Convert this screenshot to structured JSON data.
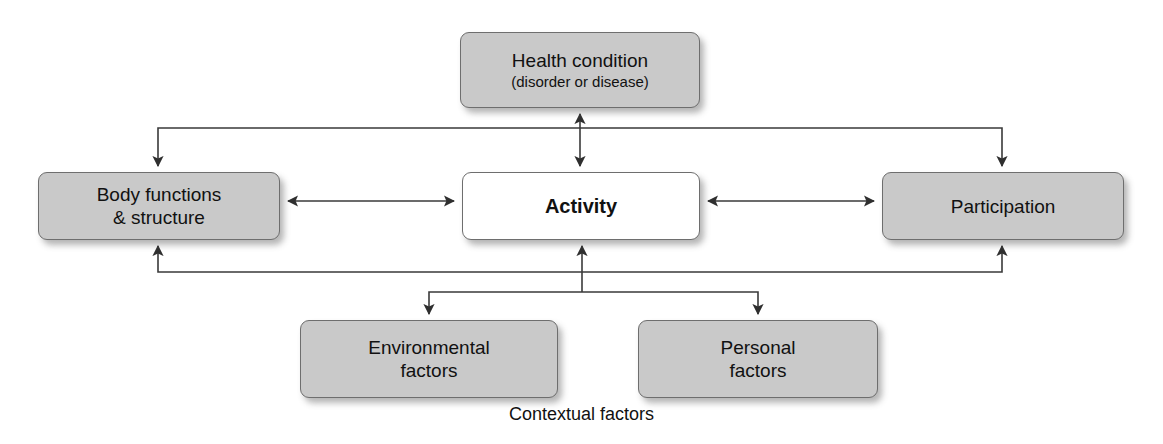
{
  "diagram": {
    "colors": {
      "node_fill": "#c9c9c9",
      "node_fill_highlight": "#ffffff",
      "node_border": "#6e6e6e",
      "edge": "#3a3a3a",
      "text": "#111111",
      "background": "#ffffff"
    },
    "nodes": [
      {
        "id": "health-condition",
        "line1": "Health condition",
        "sub": "(disorder or disease)",
        "fill": "#c9c9c9"
      },
      {
        "id": "body-functions",
        "line1": "Body functions",
        "line2": "& structure",
        "fill": "#c9c9c9"
      },
      {
        "id": "activity",
        "line1": "Activity",
        "fill": "#ffffff"
      },
      {
        "id": "participation",
        "line1": "Participation",
        "fill": "#c9c9c9"
      },
      {
        "id": "environmental-factors",
        "line1": "Environmental",
        "line2": "factors",
        "fill": "#c9c9c9"
      },
      {
        "id": "personal-factors",
        "line1": "Personal",
        "line2": "factors",
        "fill": "#c9c9c9"
      }
    ],
    "caption": "Contextual factors",
    "edges": [
      {
        "id": "health-activity",
        "from": "health-condition",
        "to": "activity",
        "arrows": "both",
        "kind": "vertical"
      },
      {
        "id": "body-activity",
        "from": "body-functions",
        "to": "activity",
        "arrows": "both",
        "kind": "horizontal"
      },
      {
        "id": "activity-participation",
        "from": "activity",
        "to": "participation",
        "arrows": "both",
        "kind": "horizontal"
      },
      {
        "id": "health-body",
        "from": "health-condition",
        "to": "body-functions",
        "arrows": "end",
        "kind": "elbow-top-left"
      },
      {
        "id": "health-participation",
        "from": "health-condition",
        "to": "participation",
        "arrows": "end",
        "kind": "elbow-top-right"
      },
      {
        "id": "contextual-body",
        "from": "contextual-factors",
        "to": "body-functions",
        "arrows": "end",
        "kind": "elbow-bottom-left"
      },
      {
        "id": "contextual-activity",
        "from": "contextual-factors",
        "to": "activity",
        "arrows": "end",
        "kind": "vertical"
      },
      {
        "id": "contextual-participation",
        "from": "contextual-factors",
        "to": "participation",
        "arrows": "end",
        "kind": "elbow-bottom-right"
      },
      {
        "id": "branch-environmental",
        "from": "contextual-factors",
        "to": "environmental-factors",
        "arrows": "end",
        "kind": "elbow-branch-left"
      },
      {
        "id": "branch-personal",
        "from": "contextual-factors",
        "to": "personal-factors",
        "arrows": "end",
        "kind": "elbow-branch-right"
      }
    ]
  }
}
